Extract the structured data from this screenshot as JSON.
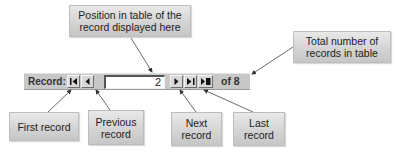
{
  "callouts": {
    "position": "Position in table of the record displayed here",
    "position_lines": [
      "Position in table of the",
      "record displayed here"
    ],
    "total_lines": [
      "Total number of",
      "records in table"
    ],
    "first": "First record",
    "previous_lines": [
      "Previous",
      "record"
    ],
    "next_lines": [
      "Next",
      "record"
    ],
    "last_lines": [
      "Last",
      "record"
    ]
  },
  "navigator": {
    "label": "Record:",
    "current_record": "2",
    "of_text": "of 8",
    "buttons": [
      {
        "name": "first-record",
        "icon": "first-icon"
      },
      {
        "name": "previous-record",
        "icon": "previous-icon"
      },
      {
        "name": "next-record",
        "icon": "next-icon"
      },
      {
        "name": "last-record",
        "icon": "last-icon"
      },
      {
        "name": "new-record",
        "icon": "new-record-icon"
      }
    ]
  }
}
